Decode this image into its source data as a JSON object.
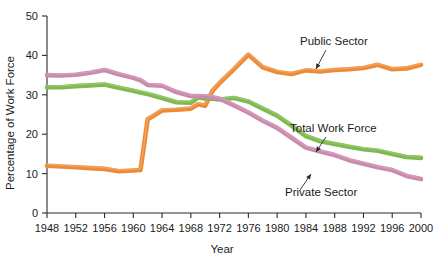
{
  "chart_data": {
    "type": "line",
    "title": "",
    "xlabel": "Year",
    "ylabel": "Percentage of Work Force",
    "xlim": [
      1948,
      2000
    ],
    "ylim": [
      0,
      50
    ],
    "grid": false,
    "legend_position": "inline-annotations",
    "x_ticks": [
      1948,
      1952,
      1956,
      1960,
      1964,
      1968,
      1972,
      1976,
      1980,
      1984,
      1988,
      1992,
      1996,
      2000
    ],
    "y_ticks": [
      0,
      10,
      20,
      30,
      40,
      50
    ],
    "x": [
      1948,
      1950,
      1952,
      1954,
      1956,
      1958,
      1960,
      1961,
      1962,
      1964,
      1966,
      1968,
      1969,
      1970,
      1971,
      1972,
      1974,
      1976,
      1978,
      1980,
      1982,
      1984,
      1986,
      1988,
      1990,
      1992,
      1994,
      1996,
      1998,
      2000
    ],
    "series": [
      {
        "name": "Public Sector",
        "color": "#ED8A38",
        "highlight": "#F7B477",
        "values": [
          12.0,
          11.8,
          11.6,
          11.4,
          11.2,
          10.6,
          10.8,
          10.9,
          23.8,
          26.0,
          26.2,
          26.5,
          27.6,
          27.2,
          31.0,
          33.0,
          36.5,
          40.2,
          37.0,
          35.8,
          35.3,
          36.2,
          35.9,
          36.3,
          36.5,
          36.8,
          37.6,
          36.5,
          36.7,
          37.6
        ]
      },
      {
        "name": "Total Work Force",
        "color": "#7FB950",
        "highlight": "#A8D27E",
        "values": [
          31.9,
          31.9,
          32.2,
          32.4,
          32.6,
          31.8,
          31.0,
          30.6,
          30.2,
          29.2,
          28.1,
          28.0,
          29.3,
          29.1,
          29.0,
          28.8,
          29.2,
          28.3,
          26.5,
          24.7,
          22.2,
          19.5,
          18.2,
          17.5,
          16.8,
          16.2,
          15.8,
          15.0,
          14.2,
          14.0
        ]
      },
      {
        "name": "Private Sector",
        "color": "#C98AAE",
        "highlight": "#DCA9C4",
        "values": [
          35.0,
          34.9,
          35.1,
          35.6,
          36.3,
          35.2,
          34.3,
          33.7,
          32.5,
          32.3,
          30.7,
          29.7,
          29.7,
          29.6,
          29.4,
          29.0,
          27.3,
          25.5,
          23.4,
          21.6,
          19.1,
          16.6,
          15.6,
          14.7,
          13.4,
          12.5,
          11.6,
          10.9,
          9.4,
          8.6
        ]
      }
    ],
    "annotations": [
      {
        "text": "Public Sector",
        "label_x": 300,
        "label_y": 45,
        "leader_from": [
          326,
          50
        ],
        "leader_to": [
          316,
          69
        ],
        "series": "Public Sector"
      },
      {
        "text": "Total Work Force",
        "label_x": 290,
        "label_y": 132,
        "leader_from": [
          326,
          137
        ],
        "leader_to": [
          316,
          152
        ],
        "series": "Total Work Force"
      },
      {
        "text": "Private Sector",
        "label_x": 285,
        "label_y": 196,
        "leader_from": [
          300,
          190
        ],
        "leader_to": [
          311,
          174
        ],
        "series": "Private Sector"
      }
    ]
  },
  "axes": {
    "y_label_text": "Percentage of Work Force",
    "x_label_text": "Year"
  }
}
